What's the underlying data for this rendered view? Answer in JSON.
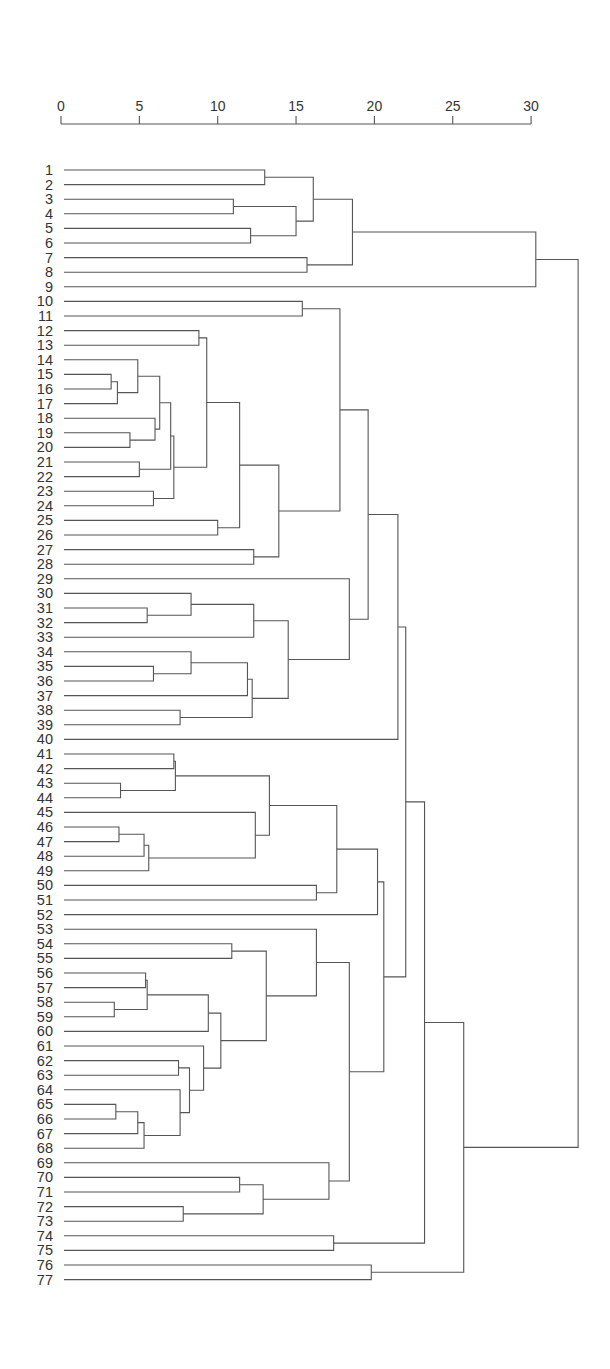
{
  "chart_data": {
    "type": "dendrogram",
    "title": "",
    "xlabel": "",
    "ylabel": "",
    "axis": {
      "position": "top",
      "ticks": [
        0,
        5,
        10,
        15,
        20,
        25,
        30
      ],
      "range": [
        0,
        30
      ]
    },
    "leaves": [
      "1",
      "2",
      "3",
      "4",
      "5",
      "6",
      "7",
      "8",
      "9",
      "10",
      "11",
      "12",
      "13",
      "14",
      "15",
      "16",
      "17",
      "18",
      "19",
      "20",
      "21",
      "22",
      "23",
      "24",
      "25",
      "26",
      "27",
      "28",
      "29",
      "30",
      "31",
      "32",
      "33",
      "34",
      "35",
      "36",
      "37",
      "38",
      "39",
      "40",
      "41",
      "42",
      "43",
      "44",
      "45",
      "46",
      "47",
      "48",
      "49",
      "50",
      "51",
      "52",
      "53",
      "54",
      "55",
      "56",
      "57",
      "58",
      "59",
      "60",
      "61",
      "62",
      "63",
      "64",
      "65",
      "66",
      "67",
      "68",
      "69",
      "70",
      "71",
      "72",
      "73",
      "74",
      "75",
      "76",
      "77"
    ],
    "merges": [
      {
        "id": "c1",
        "a": "1",
        "b": "2",
        "h": 13.0
      },
      {
        "id": "c2",
        "a": "3",
        "b": "4",
        "h": 11.0
      },
      {
        "id": "c3",
        "a": "5",
        "b": "6",
        "h": 12.1
      },
      {
        "id": "c4",
        "a": "c2",
        "b": "c3",
        "h": 15.0
      },
      {
        "id": "c5",
        "a": "c1",
        "b": "c4",
        "h": 16.1
      },
      {
        "id": "c6",
        "a": "7",
        "b": "8",
        "h": 15.7
      },
      {
        "id": "c7",
        "a": "c5",
        "b": "c6",
        "h": 18.6
      },
      {
        "id": "c8",
        "a": "c7",
        "b": "9",
        "h": 30.3
      },
      {
        "id": "c9",
        "a": "10",
        "b": "11",
        "h": 15.4
      },
      {
        "id": "c10",
        "a": "12",
        "b": "13",
        "h": 8.8
      },
      {
        "id": "c11",
        "a": "15",
        "b": "16",
        "h": 3.2
      },
      {
        "id": "c12",
        "a": "c11",
        "b": "17",
        "h": 3.6
      },
      {
        "id": "c13",
        "a": "14",
        "b": "c12",
        "h": 4.9
      },
      {
        "id": "c14",
        "a": "19",
        "b": "20",
        "h": 4.4
      },
      {
        "id": "c15",
        "a": "18",
        "b": "c14",
        "h": 6.0
      },
      {
        "id": "c16",
        "a": "c13",
        "b": "c15",
        "h": 6.3
      },
      {
        "id": "c17",
        "a": "21",
        "b": "22",
        "h": 5.0
      },
      {
        "id": "c18",
        "a": "c16",
        "b": "c17",
        "h": 7.0
      },
      {
        "id": "c19",
        "a": "23",
        "b": "24",
        "h": 5.9
      },
      {
        "id": "c20",
        "a": "c18",
        "b": "c19",
        "h": 7.2
      },
      {
        "id": "c21",
        "a": "c10",
        "b": "c20",
        "h": 9.3
      },
      {
        "id": "c22",
        "a": "25",
        "b": "26",
        "h": 10.0
      },
      {
        "id": "c23",
        "a": "c21",
        "b": "c22",
        "h": 11.4
      },
      {
        "id": "c24",
        "a": "27",
        "b": "28",
        "h": 12.3
      },
      {
        "id": "c25",
        "a": "c23",
        "b": "c24",
        "h": 13.9
      },
      {
        "id": "c26",
        "a": "c9",
        "b": "c25",
        "h": 17.8
      },
      {
        "id": "c27",
        "a": "31",
        "b": "32",
        "h": 5.5
      },
      {
        "id": "c28",
        "a": "30",
        "b": "c27",
        "h": 8.3
      },
      {
        "id": "c29",
        "a": "c28",
        "b": "33",
        "h": 12.3
      },
      {
        "id": "c30",
        "a": "35",
        "b": "36",
        "h": 5.9
      },
      {
        "id": "c31",
        "a": "34",
        "b": "c30",
        "h": 8.3
      },
      {
        "id": "c32",
        "a": "c31",
        "b": "37",
        "h": 11.9
      },
      {
        "id": "c33",
        "a": "38",
        "b": "39",
        "h": 7.6
      },
      {
        "id": "c34",
        "a": "c32",
        "b": "c33",
        "h": 12.2
      },
      {
        "id": "c35",
        "a": "c29",
        "b": "c34",
        "h": 14.5
      },
      {
        "id": "c36",
        "a": "29",
        "b": "c35",
        "h": 18.4
      },
      {
        "id": "c37",
        "a": "c26",
        "b": "c36",
        "h": 19.6
      },
      {
        "id": "c38",
        "a": "c37",
        "b": "40",
        "h": 21.5
      },
      {
        "id": "c39",
        "a": "41",
        "b": "42",
        "h": 7.2
      },
      {
        "id": "c40",
        "a": "43",
        "b": "44",
        "h": 3.8
      },
      {
        "id": "c41",
        "a": "c39",
        "b": "c40",
        "h": 7.3
      },
      {
        "id": "c42",
        "a": "46",
        "b": "47",
        "h": 3.7
      },
      {
        "id": "c43",
        "a": "c42",
        "b": "48",
        "h": 5.3
      },
      {
        "id": "c44",
        "a": "c43",
        "b": "49",
        "h": 5.6
      },
      {
        "id": "c45",
        "a": "45",
        "b": "c44",
        "h": 12.4
      },
      {
        "id": "c46",
        "a": "c41",
        "b": "c45",
        "h": 13.3
      },
      {
        "id": "c47",
        "a": "50",
        "b": "51",
        "h": 16.3
      },
      {
        "id": "c48",
        "a": "c46",
        "b": "c47",
        "h": 17.6
      },
      {
        "id": "c49",
        "a": "c48",
        "b": "52",
        "h": 20.2
      },
      {
        "id": "c50",
        "a": "54",
        "b": "55",
        "h": 10.9
      },
      {
        "id": "c51",
        "a": "56",
        "b": "57",
        "h": 5.4
      },
      {
        "id": "c52",
        "a": "58",
        "b": "59",
        "h": 3.4
      },
      {
        "id": "c53",
        "a": "c51",
        "b": "c52",
        "h": 5.5
      },
      {
        "id": "c54",
        "a": "c53",
        "b": "60",
        "h": 9.4
      },
      {
        "id": "c55",
        "a": "62",
        "b": "63",
        "h": 7.5
      },
      {
        "id": "c56",
        "a": "65",
        "b": "66",
        "h": 3.5
      },
      {
        "id": "c57",
        "a": "c56",
        "b": "67",
        "h": 4.9
      },
      {
        "id": "c58",
        "a": "c57",
        "b": "68",
        "h": 5.3
      },
      {
        "id": "c59",
        "a": "64",
        "b": "c58",
        "h": 7.6
      },
      {
        "id": "c60",
        "a": "c55",
        "b": "c59",
        "h": 8.2
      },
      {
        "id": "c61",
        "a": "61",
        "b": "c60",
        "h": 9.1
      },
      {
        "id": "c62",
        "a": "c54",
        "b": "c61",
        "h": 10.2
      },
      {
        "id": "c63",
        "a": "c50",
        "b": "c62",
        "h": 13.1
      },
      {
        "id": "c64",
        "a": "53",
        "b": "c63",
        "h": 16.3
      },
      {
        "id": "c65",
        "a": "70",
        "b": "71",
        "h": 11.4
      },
      {
        "id": "c66",
        "a": "72",
        "b": "73",
        "h": 7.8
      },
      {
        "id": "c67",
        "a": "c65",
        "b": "c66",
        "h": 12.9
      },
      {
        "id": "c68",
        "a": "69",
        "b": "c67",
        "h": 17.1
      },
      {
        "id": "c69",
        "a": "c64",
        "b": "c68",
        "h": 18.4
      },
      {
        "id": "c70",
        "a": "c49",
        "b": "c69",
        "h": 20.6
      },
      {
        "id": "c71",
        "a": "c38",
        "b": "c70",
        "h": 22.0
      },
      {
        "id": "c72",
        "a": "74",
        "b": "75",
        "h": 17.4
      },
      {
        "id": "c73",
        "a": "c71",
        "b": "c72",
        "h": 23.2
      },
      {
        "id": "c74",
        "a": "76",
        "b": "77",
        "h": 19.8
      },
      {
        "id": "c75",
        "a": "c73",
        "b": "c74",
        "h": 25.7
      },
      {
        "id": "c76",
        "a": "c8",
        "b": "c75",
        "h": 33.0
      }
    ],
    "layout": {
      "x0": 61,
      "px_per_unit": 15.67,
      "axis_y": 124,
      "tick_label_y": 111,
      "leaf_y0": 170,
      "leaf_dy": 14.6,
      "label_right_x": 53,
      "line_start_x": 64
    }
  }
}
